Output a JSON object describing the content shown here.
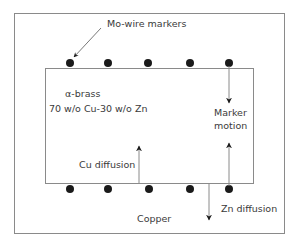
{
  "diagram": {
    "type": "kirkendall-experiment",
    "labels": {
      "markers": "Mo-wire markers",
      "alloy_name": "α-brass",
      "alloy_composition": "70 w/o Cu-30 w/o Zn",
      "marker_motion_line1": "Marker",
      "marker_motion_line2": "motion",
      "cu_diffusion": "Cu diffusion",
      "zn_diffusion": "Zn diffusion",
      "copper": "Copper"
    },
    "marker_count_top": 5,
    "marker_count_bottom": 5,
    "colors": {
      "line": "#8a8a8a",
      "marker": "#1a1a1a",
      "text": "#3a3a3a"
    }
  }
}
